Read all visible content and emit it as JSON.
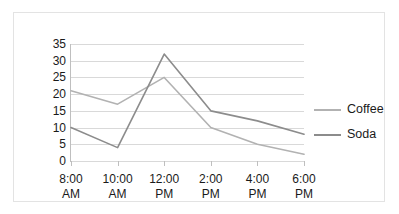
{
  "chart_data": {
    "type": "line",
    "title": "",
    "subtitle": "",
    "xlabel": "",
    "ylabel": "",
    "categories": [
      "8:00 AM",
      "10:00 AM",
      "12:00 PM",
      "2:00 PM",
      "4:00 PM",
      "6:00 PM"
    ],
    "category_lines": [
      [
        "8:00",
        "AM"
      ],
      [
        "10:00",
        "AM"
      ],
      [
        "12:00",
        "PM"
      ],
      [
        "2:00",
        "PM"
      ],
      [
        "4:00",
        "PM"
      ],
      [
        "6:00",
        "PM"
      ]
    ],
    "series": [
      {
        "name": "Coffee",
        "values": [
          21,
          17,
          25,
          10,
          5,
          2
        ],
        "color": "#b2b2b2"
      },
      {
        "name": "Soda",
        "values": [
          10,
          4,
          32,
          15,
          12,
          8
        ],
        "color": "#8c8c8c"
      }
    ],
    "ylim": [
      0,
      35
    ],
    "ytick_step": 5,
    "yticks": [
      35,
      30,
      25,
      20,
      15,
      10,
      5,
      0
    ],
    "grid": true,
    "legend_position": "right",
    "legend_entries": [
      "Coffee",
      "Soda"
    ],
    "plot_background": "#ffffff",
    "gridline_color": "#d9d9d9",
    "axis_color": "#bfbfbf",
    "border_color": "#e3e3e3",
    "text_color": "#1a1a1a"
  }
}
